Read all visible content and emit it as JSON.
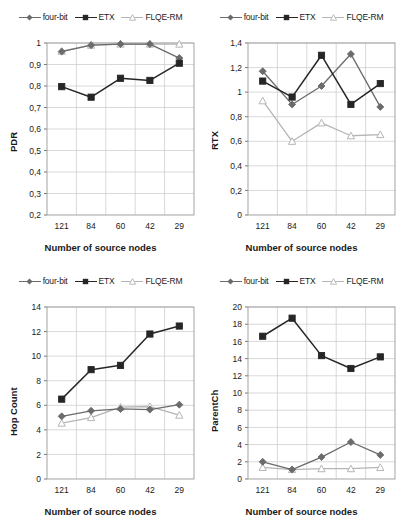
{
  "figure": {
    "background": "#ffffff",
    "series_styles": {
      "four-bit": {
        "color": "#6b6b6b",
        "marker": "diamond",
        "filled": true
      },
      "ETX": {
        "color": "#262626",
        "marker": "square",
        "filled": true
      },
      "FLQE-RM": {
        "color": "#b5b5b5",
        "marker": "triangle",
        "filled": false
      }
    }
  },
  "legend": {
    "entries": [
      {
        "label": "four-bit",
        "marker": "diamond-marker",
        "color": "#6b6b6b"
      },
      {
        "label": "ETX",
        "marker": "square-marker",
        "color": "#262626"
      },
      {
        "label": "FLQE-RM",
        "marker": "triangle-marker",
        "color": "#b5b5b5"
      }
    ]
  },
  "chart_data": [
    {
      "type": "line",
      "id": "pdr",
      "title": "",
      "xlabel": "Number of source nodes",
      "ylabel": "PDR",
      "categories": [
        "121",
        "84",
        "60",
        "42",
        "29"
      ],
      "ylim": [
        0.2,
        1.0
      ],
      "yticks": [
        0.2,
        0.3,
        0.4,
        0.5,
        0.6,
        0.7,
        0.8,
        0.9,
        1.0
      ],
      "ytick_labels": [
        "0,2",
        "0,3",
        "0,4",
        "0,5",
        "0,6",
        "0,7",
        "0,8",
        "0,9",
        "1"
      ],
      "grid": true,
      "legend_position": "top",
      "series": [
        {
          "name": "four-bit",
          "values": [
            0.96,
            0.99,
            0.995,
            0.995,
            0.93
          ]
        },
        {
          "name": "ETX",
          "values": [
            0.797,
            0.748,
            0.836,
            0.826,
            0.906
          ]
        },
        {
          "name": "FLQE-RM",
          "values": [
            0.962,
            0.99,
            0.995,
            0.995,
            0.995
          ]
        }
      ]
    },
    {
      "type": "line",
      "id": "rtx",
      "title": "",
      "xlabel": "Number of source nodes",
      "ylabel": "RTX",
      "categories": [
        "121",
        "84",
        "60",
        "42",
        "29"
      ],
      "ylim": [
        0,
        1.4
      ],
      "yticks": [
        0,
        0.2,
        0.4,
        0.6,
        0.8,
        1.0,
        1.2,
        1.4
      ],
      "ytick_labels": [
        "0",
        "0,2",
        "0,4",
        "0,6",
        "0,8",
        "1",
        "1,2",
        "1,4"
      ],
      "grid": true,
      "legend_position": "top",
      "series": [
        {
          "name": "four-bit",
          "values": [
            1.17,
            0.9,
            1.05,
            1.31,
            0.88
          ]
        },
        {
          "name": "ETX",
          "values": [
            1.09,
            0.96,
            1.3,
            0.9,
            1.07
          ]
        },
        {
          "name": "FLQE-RM",
          "values": [
            0.93,
            0.6,
            0.75,
            0.645,
            0.655
          ]
        }
      ]
    },
    {
      "type": "line",
      "id": "hop-count",
      "title": "",
      "xlabel": "Number of source nodes",
      "ylabel": "Hop Count",
      "categories": [
        "121",
        "84",
        "60",
        "42",
        "29"
      ],
      "ylim": [
        0,
        14
      ],
      "yticks": [
        0,
        2,
        4,
        6,
        8,
        10,
        12,
        14
      ],
      "ytick_labels": [
        "0",
        "2",
        "4",
        "6",
        "8",
        "10",
        "12",
        "14"
      ],
      "grid": true,
      "legend_position": "top",
      "series": [
        {
          "name": "four-bit",
          "values": [
            5.1,
            5.55,
            5.7,
            5.65,
            6.05
          ]
        },
        {
          "name": "ETX",
          "values": [
            6.5,
            8.9,
            9.25,
            11.8,
            12.45
          ]
        },
        {
          "name": "FLQE-RM",
          "values": [
            4.55,
            5.0,
            5.85,
            5.9,
            5.2
          ]
        }
      ]
    },
    {
      "type": "line",
      "id": "parentch",
      "title": "",
      "xlabel": "Number of source nodes",
      "ylabel": "ParentCh",
      "categories": [
        "121",
        "84",
        "60",
        "42",
        "29"
      ],
      "ylim": [
        0,
        20
      ],
      "yticks": [
        0,
        2,
        4,
        6,
        8,
        10,
        12,
        14,
        16,
        18,
        20
      ],
      "ytick_labels": [
        "0",
        "2",
        "4",
        "6",
        "8",
        "10",
        "12",
        "14",
        "16",
        "18",
        "20"
      ],
      "grid": true,
      "legend_position": "top",
      "series": [
        {
          "name": "four-bit",
          "values": [
            2.0,
            1.1,
            2.55,
            4.3,
            2.8
          ]
        },
        {
          "name": "ETX",
          "values": [
            16.6,
            18.7,
            14.35,
            12.85,
            14.2
          ]
        },
        {
          "name": "FLQE-RM",
          "values": [
            1.35,
            1.1,
            1.2,
            1.2,
            1.35
          ]
        }
      ]
    }
  ]
}
